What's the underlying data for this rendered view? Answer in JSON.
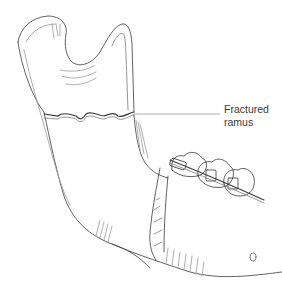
{
  "figure": {
    "annotations": [
      {
        "line1": "Fractured",
        "line2": "ramus"
      }
    ],
    "colors": {
      "line": "#3a3a3a",
      "light_line": "#9a9a9a",
      "background": "#ffffff"
    }
  }
}
